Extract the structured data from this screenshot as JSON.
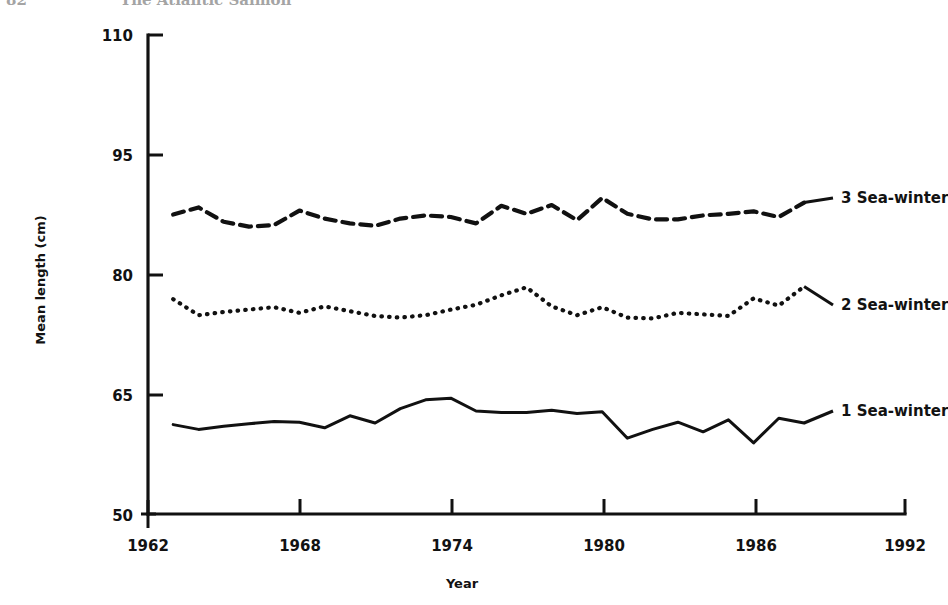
{
  "page": {
    "folio": "82",
    "running_title": "The Atlantic Salmon"
  },
  "chart_data": {
    "type": "line",
    "title": "",
    "xlabel": "Year",
    "ylabel": "Mean length (cm)",
    "xlim": [
      1962,
      1992
    ],
    "ylim": [
      50,
      110
    ],
    "xticks": [
      1962,
      1968,
      1974,
      1980,
      1986,
      1992
    ],
    "yticks": [
      50,
      65,
      80,
      95,
      110
    ],
    "grid": false,
    "legend_position": "right-inline",
    "x": [
      1963,
      1964,
      1965,
      1966,
      1967,
      1968,
      1969,
      1970,
      1971,
      1972,
      1973,
      1974,
      1975,
      1976,
      1977,
      1978,
      1979,
      1980,
      1981,
      1982,
      1983,
      1984,
      1985,
      1986,
      1987,
      1988
    ],
    "series": [
      {
        "name": "3 Sea-winter",
        "label": "3 Sea-winter",
        "style": "dashed",
        "color": "#111111",
        "values": [
          87.5,
          88.4,
          86.6,
          86.0,
          86.2,
          88.0,
          87.0,
          86.4,
          86.1,
          87.0,
          87.4,
          87.2,
          86.4,
          88.6,
          87.6,
          88.7,
          86.8,
          89.6,
          87.6,
          86.9,
          86.9,
          87.4,
          87.6,
          87.9,
          87.2,
          89.0
        ]
      },
      {
        "name": "2 Sea-winter",
        "label": "2 Sea-winter",
        "style": "dotted",
        "color": "#111111",
        "values": [
          76.9,
          74.9,
          75.3,
          75.6,
          75.9,
          75.2,
          76.0,
          75.4,
          74.8,
          74.6,
          74.9,
          75.6,
          76.2,
          77.4,
          78.4,
          76.0,
          74.9,
          75.9,
          74.6,
          74.5,
          75.2,
          75.0,
          74.8,
          77.0,
          76.1,
          78.5
        ]
      },
      {
        "name": "1 Sea-winter",
        "label": "1 Sea-winter",
        "style": "solid",
        "color": "#111111",
        "values": [
          61.2,
          60.6,
          61.0,
          61.3,
          61.6,
          61.5,
          60.8,
          62.3,
          61.4,
          63.2,
          64.3,
          64.5,
          62.9,
          62.7,
          62.7,
          63.0,
          62.6,
          62.8,
          59.5,
          60.6,
          61.5,
          60.3,
          61.8,
          58.9,
          62.0,
          61.4
        ]
      }
    ]
  }
}
